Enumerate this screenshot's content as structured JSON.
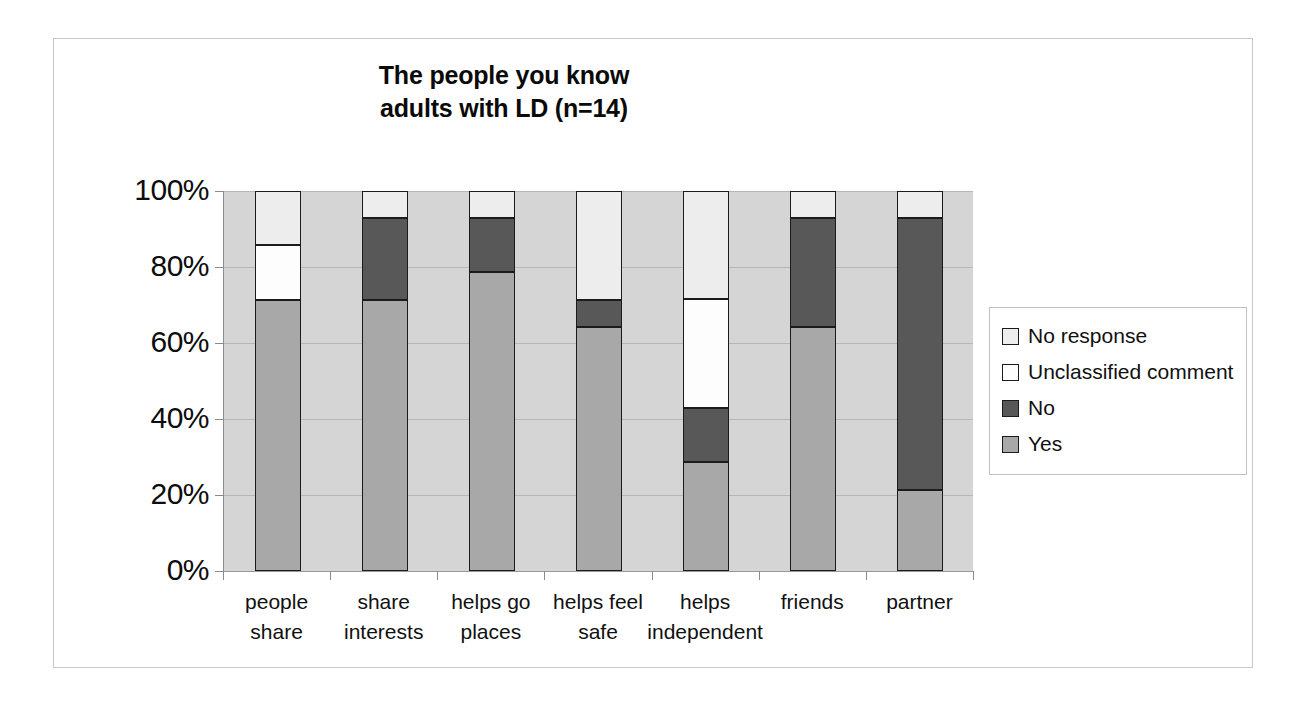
{
  "chart_data": {
    "type": "bar",
    "subtype": "stacked-100-percent",
    "title": "The people you know adults with LD (n=14)",
    "title_lines": [
      "The people you know",
      "adults with LD (n=14)"
    ],
    "xlabel": "",
    "ylabel": "",
    "ylim": [
      0,
      100
    ],
    "ytick_labels": [
      "0%",
      "20%",
      "40%",
      "60%",
      "80%",
      "100%"
    ],
    "ytick_values": [
      0,
      20,
      40,
      60,
      80,
      100
    ],
    "grid": true,
    "legend_position": "right",
    "sample_size": 14,
    "categories": [
      "people share",
      "share interests",
      "helps go places",
      "helps feel safe",
      "helps independent",
      "friends",
      "partner"
    ],
    "category_lines": [
      [
        "people",
        "share"
      ],
      [
        "share",
        "interests"
      ],
      [
        "helps go",
        "places"
      ],
      [
        "helps feel",
        "safe"
      ],
      [
        "helps",
        "independent"
      ],
      [
        "friends",
        ""
      ],
      [
        "partner",
        ""
      ]
    ],
    "series": [
      {
        "name": "Yes",
        "color": "#a8a8a8",
        "values": [
          71.4,
          71.4,
          78.6,
          64.3,
          28.6,
          64.3,
          21.4
        ],
        "counts": [
          10,
          10,
          11,
          9,
          4,
          9,
          3
        ]
      },
      {
        "name": "No",
        "color": "#585858",
        "values": [
          0.0,
          21.4,
          14.3,
          7.1,
          14.3,
          28.6,
          71.4
        ],
        "counts": [
          0,
          3,
          2,
          1,
          2,
          4,
          10
        ]
      },
      {
        "name": "Unclassified comment",
        "color": "#fdfdfd",
        "values": [
          14.3,
          0.0,
          0.0,
          0.0,
          28.6,
          0.0,
          0.0
        ],
        "counts": [
          2,
          0,
          0,
          0,
          4,
          0,
          0
        ]
      },
      {
        "name": "No response",
        "color": "#ededed",
        "values": [
          14.3,
          7.1,
          7.1,
          28.6,
          28.6,
          7.1,
          7.1
        ],
        "counts": [
          2,
          1,
          1,
          4,
          4,
          1,
          1
        ]
      }
    ],
    "legend_entries": [
      {
        "label": "No response",
        "color": "#ededed"
      },
      {
        "label": "Unclassified comment",
        "color": "#fdfdfd"
      },
      {
        "label": "No",
        "color": "#585858"
      },
      {
        "label": "Yes",
        "color": "#a8a8a8"
      }
    ],
    "colors": {
      "plot_background": "#d5d5d5",
      "gridline": "#b6b6b6",
      "segment_border": "#1b1b1b",
      "frame_border": "#c8c8c8",
      "text": "#101010"
    }
  }
}
